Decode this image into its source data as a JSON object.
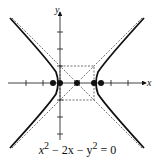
{
  "diagram": {
    "type": "hyperbola",
    "equation": "x² − 2x − y² = 0",
    "equation_parts": {
      "a": "x",
      "b": "2",
      "c": " − 2x − y",
      "d": "2",
      "e": " = 0"
    },
    "axes": {
      "x_label": "x",
      "y_label": "y"
    },
    "center": [
      1,
      0
    ],
    "vertices": [
      [
        0,
        0
      ],
      [
        2,
        0
      ]
    ],
    "foci": [
      [
        -0.414,
        0
      ],
      [
        2.414,
        0
      ]
    ],
    "asymptotes": [
      "y = x − 1",
      "y = −(x − 1)"
    ],
    "fundamental_rectangle": {
      "x": [
        0,
        2
      ],
      "y": [
        -1,
        1
      ]
    }
  }
}
